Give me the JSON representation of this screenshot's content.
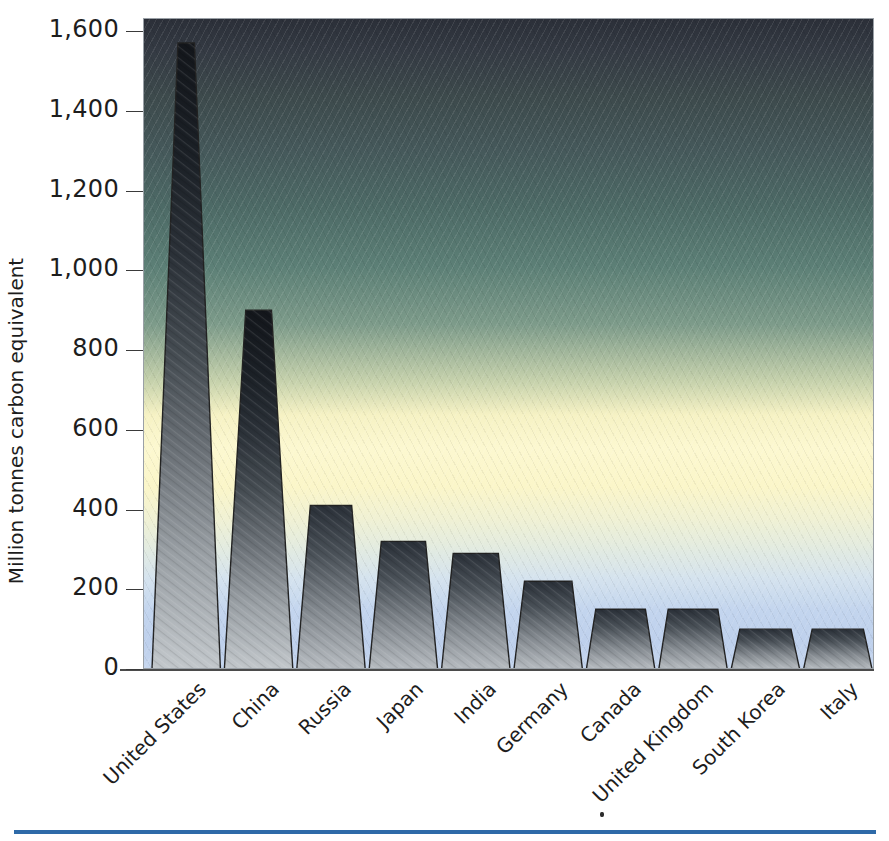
{
  "chart_data": {
    "type": "bar",
    "title": "",
    "xlabel": "",
    "ylabel": "Million tonnes carbon equivalent",
    "ylim": [
      0,
      1600
    ],
    "grid": false,
    "legend": "none",
    "categories": [
      "United States",
      "China",
      "Russia",
      "Japan",
      "India",
      "Germany",
      "Canada",
      "United Kingdom",
      "South Korea",
      "Italy"
    ],
    "values": [
      1570,
      900,
      410,
      320,
      290,
      220,
      150,
      150,
      100,
      100
    ],
    "y_ticks": [
      0,
      200,
      400,
      600,
      800,
      1000,
      1200,
      1400,
      1600
    ],
    "y_tick_labels": [
      "0",
      "200",
      "400",
      "600",
      "800",
      "1,000",
      "1,200",
      "1,400",
      "1,600"
    ]
  },
  "style": {
    "bar_top_color": "#161a20",
    "bar_bottom_color": "#b9bfc4",
    "bar_edge_color": "#222222",
    "background_top_color": "#2b2f38",
    "background_mid_color": "#fcf8d0",
    "background_bottom_color": "#c3d5ee",
    "axis_color": "#3a3a3a",
    "rule_color": "#2e6aa8",
    "text_color": "#1d1d1d"
  }
}
